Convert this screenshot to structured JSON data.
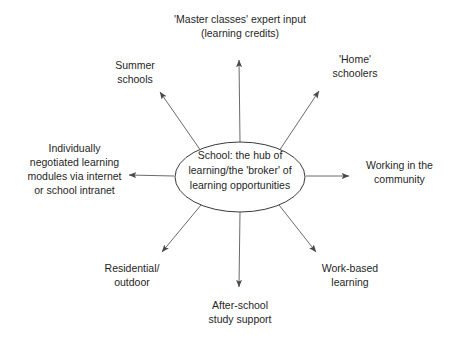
{
  "diagram": {
    "type": "hub-and-spoke",
    "hub": {
      "id": "school-hub",
      "text": "School: the hub of\nlearning/the 'broker' of\nlearning opportunities",
      "shape": "ellipse",
      "center": [
        240,
        177
      ],
      "radius_x": 65,
      "radius_y": 35,
      "stroke_color": "#3a3a3a",
      "fill_color": "#ffffff"
    },
    "spoke_color": "#5a5a5a",
    "text_color": "#1f1f1f",
    "background_color": "#ffffff",
    "nodes": [
      {
        "id": "master-classes",
        "text": "'Master classes' expert input\n(learning credits)",
        "direction": "up",
        "arrow": {
          "x1": 240,
          "y1": 142,
          "x2": 239,
          "y2": 54
        }
      },
      {
        "id": "summer-schools",
        "text": "Summer\nschools",
        "direction": "up-left",
        "arrow": {
          "x1": 201,
          "y1": 151,
          "x2": 156,
          "y2": 87
        }
      },
      {
        "id": "home-schoolers",
        "text": "'Home'\nschoolers",
        "direction": "up-right",
        "arrow": {
          "x1": 279,
          "y1": 151,
          "x2": 323,
          "y2": 86
        }
      },
      {
        "id": "individual-modules",
        "text": "Individually\nnegotiated learning\nmodules via internet\nor school intranet",
        "direction": "left",
        "arrow": {
          "x1": 174,
          "y1": 176,
          "x2": 124,
          "y2": 175
        }
      },
      {
        "id": "working-community",
        "text": "Working in the\ncommunity",
        "direction": "right",
        "arrow": {
          "x1": 306,
          "y1": 176,
          "x2": 354,
          "y2": 176
        }
      },
      {
        "id": "residential-outdoor",
        "text": "Residential/\noutdoor",
        "direction": "down-left",
        "arrow": {
          "x1": 201,
          "y1": 205,
          "x2": 158,
          "y2": 257
        }
      },
      {
        "id": "work-based-learning",
        "text": "Work-based\nlearning",
        "direction": "down-right",
        "arrow": {
          "x1": 279,
          "y1": 205,
          "x2": 320,
          "y2": 257
        }
      },
      {
        "id": "after-school-study",
        "text": "After-school\nstudy support",
        "direction": "down",
        "arrow": {
          "x1": 240,
          "y1": 212,
          "x2": 239,
          "y2": 292
        }
      }
    ]
  }
}
